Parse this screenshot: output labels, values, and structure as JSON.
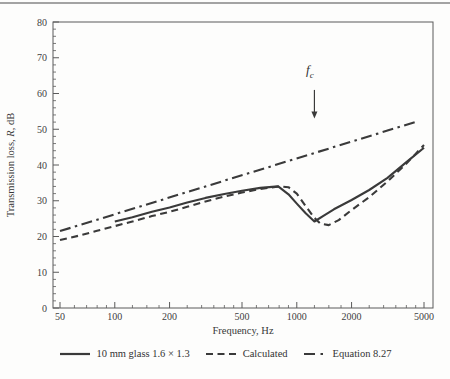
{
  "chart_data": {
    "type": "line",
    "title": "",
    "x_scale": "log",
    "xlabel": "Frequency, Hz",
    "ylabel": "Transmission loss, R, dB",
    "ylabel_parts": [
      {
        "t": "Transmission loss, "
      },
      {
        "t": "R",
        "italic": true
      },
      {
        "t": ", dB"
      }
    ],
    "xlim": [
      46,
      5600
    ],
    "ylim": [
      0,
      80
    ],
    "x_ticks": [
      50,
      100,
      200,
      500,
      1000,
      2000,
      5000
    ],
    "x_minor_ticks": [
      60,
      70,
      80,
      90,
      125,
      150,
      175,
      250,
      300,
      350,
      400,
      450,
      600,
      700,
      800,
      900,
      1250,
      1500,
      1750,
      2500,
      3000,
      3500,
      4000,
      4500
    ],
    "y_ticks": [
      0,
      10,
      20,
      30,
      40,
      50,
      60,
      70,
      80
    ],
    "y_minor_step": 2,
    "grid": false,
    "legend_position": "bottom-center",
    "ink_color": "#3a3a3a",
    "axis_color": "#5a5a5a",
    "annotation": {
      "text": "f",
      "subscript": "c",
      "x_hz": 1250,
      "arrow_top_db": 61,
      "arrow_tip_db": 53
    },
    "series": [
      {
        "name": "10 mm glass 1.6 × 1.3",
        "style": "solid",
        "points": [
          [
            100,
            24.2
          ],
          [
            125,
            25.4
          ],
          [
            160,
            26.9
          ],
          [
            200,
            28.1
          ],
          [
            250,
            29.5
          ],
          [
            315,
            30.8
          ],
          [
            400,
            31.9
          ],
          [
            500,
            32.8
          ],
          [
            630,
            33.6
          ],
          [
            790,
            34.0
          ],
          [
            900,
            31.8
          ],
          [
            1000,
            29.2
          ],
          [
            1120,
            26.5
          ],
          [
            1250,
            24.2
          ],
          [
            1400,
            25.8
          ],
          [
            1600,
            27.6
          ],
          [
            2000,
            30.2
          ],
          [
            2500,
            33.0
          ],
          [
            3150,
            36.4
          ],
          [
            4000,
            40.8
          ],
          [
            5000,
            44.8
          ]
        ]
      },
      {
        "name": "Calculated",
        "style": "dashed",
        "points": [
          [
            50,
            19.0
          ],
          [
            63,
            20.2
          ],
          [
            80,
            21.6
          ],
          [
            100,
            22.9
          ],
          [
            125,
            24.2
          ],
          [
            160,
            25.7
          ],
          [
            200,
            26.9
          ],
          [
            250,
            28.3
          ],
          [
            315,
            29.8
          ],
          [
            400,
            31.2
          ],
          [
            500,
            32.3
          ],
          [
            630,
            33.3
          ],
          [
            800,
            34.0
          ],
          [
            900,
            33.8
          ],
          [
            1000,
            32.0
          ],
          [
            1120,
            28.5
          ],
          [
            1250,
            25.2
          ],
          [
            1350,
            23.6
          ],
          [
            1500,
            23.2
          ],
          [
            1700,
            24.6
          ],
          [
            2000,
            27.4
          ],
          [
            2500,
            31.0
          ],
          [
            3150,
            35.4
          ],
          [
            4000,
            40.4
          ],
          [
            5000,
            45.6
          ]
        ]
      },
      {
        "name": "Equation 8.27",
        "style": "dashdot",
        "points": [
          [
            50,
            21.5
          ],
          [
            4600,
            52.2
          ]
        ]
      }
    ]
  }
}
